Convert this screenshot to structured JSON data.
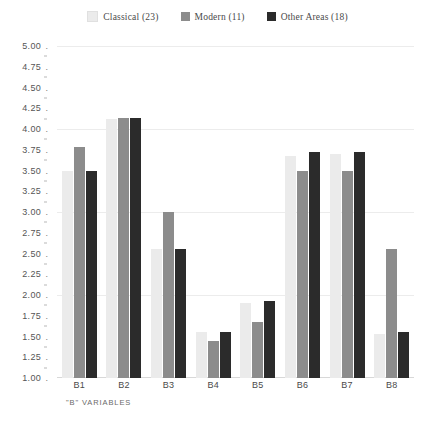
{
  "chart_data": {
    "type": "bar",
    "title": "",
    "xlabel": "\"B\" VARIABLES",
    "ylabel": "",
    "ylim": [
      1.0,
      5.0
    ],
    "ytick_step": 0.25,
    "grid": true,
    "legend_position": "top-center",
    "categories": [
      "B1",
      "B2",
      "B3",
      "B4",
      "B5",
      "B6",
      "B7",
      "B8"
    ],
    "ytick_labels": [
      "5.00",
      "4.75",
      "4.50",
      "4.25",
      "4.00",
      "3.75",
      "3.50",
      "3.25",
      "3.00",
      "2.75",
      "2.50",
      "2.25",
      "2.00",
      "1.75",
      "1.50",
      "1.25",
      "1.00"
    ],
    "series": [
      {
        "name": "Classical (23)",
        "short_name": "Classical",
        "count": 23,
        "color": "#ebebeb",
        "values": [
          3.5,
          4.12,
          2.55,
          1.55,
          1.9,
          3.68,
          3.7,
          1.53
        ]
      },
      {
        "name": "Modern (11)",
        "short_name": "Modern",
        "count": 11,
        "color": "#8c8c8c",
        "values": [
          3.78,
          4.13,
          3.0,
          1.45,
          1.68,
          3.5,
          3.5,
          2.55
        ]
      },
      {
        "name": "Other Areas (18)",
        "short_name": "Other Areas",
        "count": 18,
        "color": "#2b2b2b",
        "values": [
          3.5,
          4.13,
          2.55,
          1.55,
          1.93,
          3.72,
          3.72,
          1.55
        ]
      }
    ]
  },
  "legend": {
    "items": [
      {
        "label": "Classical (23)",
        "color": "#ebebeb"
      },
      {
        "label": "Modern (11)",
        "color": "#8c8c8c"
      },
      {
        "label": "Other Areas (18)",
        "color": "#2b2b2b"
      }
    ]
  },
  "axis": {
    "x_title": "\"B\" VARIABLES",
    "tick_dot": "."
  }
}
